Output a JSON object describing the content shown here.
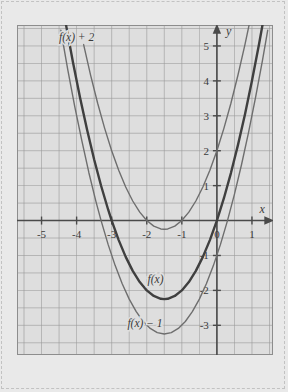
{
  "figure": {
    "background_color": "#e9e9e9",
    "plot_background_color": "#dedede",
    "grid_color": "#9a9a9a",
    "axis_color": "#4a4a4a",
    "border_color": "#8d8d8d",
    "text_color": "#3a3a3a"
  },
  "chart_data": {
    "type": "line",
    "title": "",
    "xlabel": "x",
    "ylabel": "y",
    "xlim": [
      -5.7,
      1.6
    ],
    "ylim": [
      -3.85,
      5.6
    ],
    "grid": true,
    "legend": "inline-labels",
    "x_ticks": [
      -5,
      -4,
      -3,
      -2,
      -1,
      0,
      1
    ],
    "x_tick_labels": [
      "-5",
      "-4",
      "-3",
      "-2",
      "-1",
      "0",
      "1"
    ],
    "y_ticks": [
      -3,
      -2,
      -1,
      1,
      2,
      3,
      4,
      5
    ],
    "y_tick_labels": [
      "-3",
      "-2",
      "-1",
      "1",
      "2",
      "3",
      "4",
      "5"
    ],
    "series": [
      {
        "name": "f(x) + 2",
        "label": "f(x) + 2",
        "label_x": -4.0,
        "label_y": 5.15,
        "color": "#6e6e6e",
        "stroke_width": 1.4,
        "vertex": [
          -1.5,
          -0.25
        ],
        "leading_coefficient": 1,
        "equation": "y = (x + 1.5)^2 - 0.25",
        "points": [
          [
            -3.8,
            5.04
          ],
          [
            -3.6,
            4.16
          ],
          [
            -3.4,
            3.36
          ],
          [
            -3.2,
            2.64
          ],
          [
            -3.0,
            2.0
          ],
          [
            -2.8,
            1.44
          ],
          [
            -2.6,
            0.96
          ],
          [
            -2.4,
            0.56
          ],
          [
            -2.2,
            0.24
          ],
          [
            -2.0,
            0.0
          ],
          [
            -1.8,
            -0.16
          ],
          [
            -1.6,
            -0.24
          ],
          [
            -1.5,
            -0.25
          ],
          [
            -1.4,
            -0.24
          ],
          [
            -1.2,
            -0.16
          ],
          [
            -1.0,
            0.0
          ],
          [
            -0.8,
            0.24
          ],
          [
            -0.6,
            0.56
          ],
          [
            -0.4,
            0.96
          ],
          [
            -0.2,
            1.44
          ],
          [
            0.0,
            2.0
          ],
          [
            0.2,
            2.64
          ],
          [
            0.4,
            3.36
          ],
          [
            0.6,
            4.16
          ],
          [
            0.8,
            5.04
          ],
          [
            0.95,
            5.75
          ]
        ]
      },
      {
        "name": "f(x)",
        "label": "f(x)",
        "label_x": -1.75,
        "label_y": -1.78,
        "color": "#3f3f3f",
        "stroke_width": 2.4,
        "vertex": [
          -1.5,
          -2.25
        ],
        "leading_coefficient": 1,
        "equation": "y = (x + 1.5)^2 - 2.25",
        "points": [
          [
            -4.3,
            5.59
          ],
          [
            -4.1,
            4.51
          ],
          [
            -3.9,
            3.51
          ],
          [
            -3.7,
            2.59
          ],
          [
            -3.5,
            1.75
          ],
          [
            -3.3,
            0.99
          ],
          [
            -3.1,
            0.31
          ],
          [
            -3.0,
            0.0
          ],
          [
            -2.8,
            -0.56
          ],
          [
            -2.6,
            -1.04
          ],
          [
            -2.4,
            -1.44
          ],
          [
            -2.2,
            -1.76
          ],
          [
            -2.0,
            -2.0
          ],
          [
            -1.8,
            -2.16
          ],
          [
            -1.6,
            -2.24
          ],
          [
            -1.5,
            -2.25
          ],
          [
            -1.4,
            -2.24
          ],
          [
            -1.2,
            -2.16
          ],
          [
            -1.0,
            -2.0
          ],
          [
            -0.8,
            -1.76
          ],
          [
            -0.6,
            -1.44
          ],
          [
            -0.4,
            -1.04
          ],
          [
            -0.2,
            -0.56
          ],
          [
            0.0,
            0.0
          ],
          [
            0.2,
            0.64
          ],
          [
            0.4,
            1.36
          ],
          [
            0.6,
            2.16
          ],
          [
            0.8,
            3.04
          ],
          [
            1.0,
            4.0
          ],
          [
            1.2,
            5.04
          ],
          [
            1.32,
            5.71
          ]
        ]
      },
      {
        "name": "f(x) - 1",
        "label": "f(x) − 1",
        "label_x": -2.05,
        "label_y": -3.05,
        "color": "#6e6e6e",
        "stroke_width": 1.4,
        "vertex": [
          -1.5,
          -3.25
        ],
        "leading_coefficient": 1,
        "equation": "y = (x + 1.5)^2 - 3.25",
        "points": [
          [
            -4.45,
            5.45
          ],
          [
            -4.25,
            4.31
          ],
          [
            -4.05,
            3.25
          ],
          [
            -3.85,
            2.28
          ],
          [
            -3.65,
            1.37
          ],
          [
            -3.45,
            0.55
          ],
          [
            -3.3,
            -0.01
          ],
          [
            -3.1,
            -0.69
          ],
          [
            -2.9,
            -1.29
          ],
          [
            -2.7,
            -1.81
          ],
          [
            -2.5,
            -2.25
          ],
          [
            -2.3,
            -2.61
          ],
          [
            -2.1,
            -2.89
          ],
          [
            -1.9,
            -3.09
          ],
          [
            -1.7,
            -3.21
          ],
          [
            -1.5,
            -3.25
          ],
          [
            -1.3,
            -3.21
          ],
          [
            -1.1,
            -3.09
          ],
          [
            -0.9,
            -2.89
          ],
          [
            -0.7,
            -2.61
          ],
          [
            -0.5,
            -2.25
          ],
          [
            -0.3,
            -1.81
          ],
          [
            -0.1,
            -1.29
          ],
          [
            0.1,
            -0.69
          ],
          [
            0.3,
            -0.01
          ],
          [
            0.5,
            0.75
          ],
          [
            0.7,
            1.59
          ],
          [
            0.9,
            2.51
          ],
          [
            1.1,
            3.51
          ],
          [
            1.3,
            4.59
          ],
          [
            1.45,
            5.45
          ]
        ]
      }
    ]
  },
  "axes": {
    "x_axis_label": "x",
    "y_axis_label": "y"
  }
}
